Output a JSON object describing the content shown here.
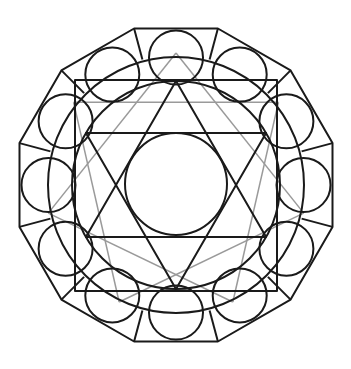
{
  "diagram": {
    "colors": {
      "primary_stroke": "#1a1a1a",
      "secondary_stroke": "#9a9a9a",
      "background": "#ffffff"
    },
    "elements": [
      {
        "name": "outer-dodecagon",
        "shape": "regular-polygon",
        "sides": 12
      },
      {
        "name": "ring-circles",
        "shape": "circle",
        "count": 12
      },
      {
        "name": "large-circle",
        "shape": "circle"
      },
      {
        "name": "square",
        "shape": "square"
      },
      {
        "name": "hexagram",
        "shape": "star",
        "notation": "{6/2}"
      },
      {
        "name": "inner-circle",
        "shape": "circle"
      },
      {
        "name": "heptagram",
        "shape": "star",
        "notation": "{7/2}"
      }
    ]
  }
}
